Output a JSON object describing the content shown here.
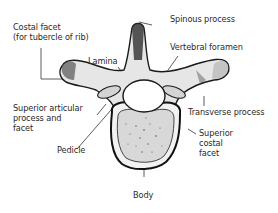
{
  "diagram": {
    "colors": {
      "ink": "#1a1a1a",
      "bone": "#e6e6e6",
      "bone_shade": "#9a9a9a",
      "label": "#2a2a2a",
      "background": "#ffffff"
    },
    "labels": [
      {
        "id": "costal-facet",
        "text": "Costal facet\n(for tubercle of rib)"
      },
      {
        "id": "spinous-process",
        "text": "Spinous process"
      },
      {
        "id": "lamina",
        "text": "Lamina"
      },
      {
        "id": "vertebral-foramen",
        "text": "Vertebral foramen"
      },
      {
        "id": "superior-articular-process",
        "text": "Superior articular\nprocess and\nfacet"
      },
      {
        "id": "transverse-process",
        "text": "Transverse process"
      },
      {
        "id": "pedicle",
        "text": "Pedicle"
      },
      {
        "id": "superior-costal-facet",
        "text": "Superior\ncostal\nfacet"
      },
      {
        "id": "body",
        "text": "Body"
      }
    ]
  }
}
